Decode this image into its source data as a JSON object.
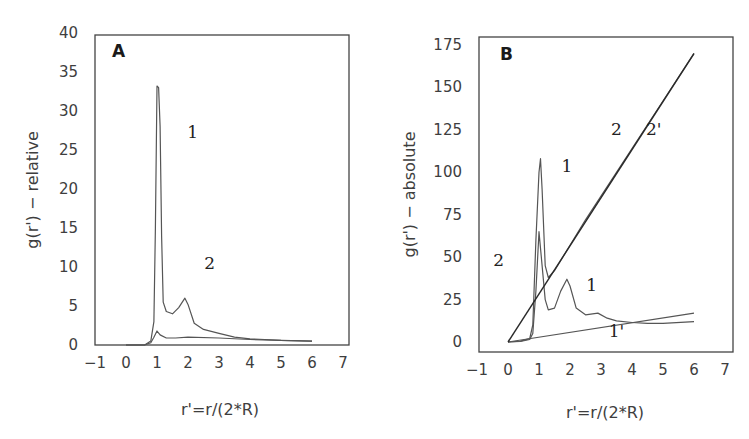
{
  "chart_data": [
    {
      "panel": "A",
      "type": "line",
      "title": "A",
      "xlabel": "r'=r/(2*R)",
      "ylabel": "g(r') − relative",
      "xlim": [
        -1,
        7
      ],
      "ylim": [
        0,
        40
      ],
      "xticks": [
        "−1",
        "0",
        "1",
        "2",
        "3",
        "4",
        "5",
        "6",
        "7"
      ],
      "yticks": [
        "0",
        "5",
        "10",
        "15",
        "20",
        "25",
        "30",
        "35",
        "40"
      ],
      "grid": false,
      "legend": "inline labels",
      "series": [
        {
          "name": "1",
          "x": [
            0.0,
            0.6,
            0.8,
            0.9,
            0.95,
            1.0,
            1.05,
            1.1,
            1.15,
            1.2,
            1.3,
            1.5,
            1.7,
            1.9,
            2.0,
            2.2,
            2.5,
            3.0,
            3.5,
            4.0,
            5.0,
            6.0
          ],
          "y": [
            0.0,
            0.0,
            0.5,
            3.0,
            15.0,
            33.2,
            33.0,
            28.0,
            14.0,
            5.5,
            4.3,
            4.0,
            4.8,
            6.0,
            5.2,
            2.8,
            2.0,
            1.5,
            1.0,
            0.8,
            0.6,
            0.5
          ]
        },
        {
          "name": "2",
          "x": [
            0.0,
            0.6,
            0.8,
            0.9,
            1.0,
            1.1,
            1.3,
            1.6,
            2.0,
            3.0,
            4.0,
            5.0,
            6.0
          ],
          "y": [
            0.0,
            0.0,
            0.3,
            1.0,
            1.8,
            1.3,
            0.9,
            0.9,
            1.0,
            0.9,
            0.7,
            0.6,
            0.5
          ]
        }
      ],
      "annotations": [
        {
          "text": "1",
          "x": 2.15,
          "y": 26.5
        },
        {
          "text": "2",
          "x": 2.7,
          "y": 9.8
        }
      ]
    },
    {
      "panel": "B",
      "type": "line",
      "title": "B",
      "xlabel": "r'=r/(2*R)",
      "ylabel": "g(r') − absolute",
      "xlim": [
        -1,
        7
      ],
      "ylim": [
        0,
        175
      ],
      "xticks": [
        "−1",
        "0",
        "1",
        "2",
        "3",
        "4",
        "5",
        "6",
        "7"
      ],
      "yticks": [
        "0",
        "25",
        "50",
        "75",
        "100",
        "125",
        "150",
        "175"
      ],
      "grid": false,
      "legend": "inline labels",
      "series": [
        {
          "name": "1",
          "x": [
            0.0,
            0.4,
            0.7,
            0.8,
            0.9,
            1.0,
            1.1,
            1.2,
            1.3,
            1.5,
            1.7,
            1.9,
            2.0,
            2.2,
            2.5,
            2.9,
            3.2,
            3.5,
            4.0,
            4.5,
            5.0,
            6.0
          ],
          "y": [
            0.0,
            0.3,
            1.5,
            5.0,
            30.0,
            65.0,
            45.0,
            25.0,
            19.0,
            20.0,
            30.0,
            37.0,
            33.0,
            20.0,
            16.0,
            17.0,
            14.0,
            12.5,
            11.5,
            11.0,
            11.0,
            12.0
          ]
        },
        {
          "name": "2",
          "x": [
            0.0,
            0.4,
            0.7,
            0.8,
            0.9,
            1.0,
            1.05,
            1.1,
            1.2,
            1.3,
            1.5,
            2.0,
            2.5,
            3.0,
            3.5,
            4.0,
            5.0,
            6.0
          ],
          "y": [
            0.0,
            0.5,
            2.0,
            10.0,
            60.0,
            100.0,
            108.0,
            90.0,
            45.0,
            38.0,
            42.0,
            57.0,
            72.0,
            86.0,
            100.0,
            114.0,
            142.0,
            170.0
          ]
        },
        {
          "name": "1'",
          "x": [
            0.0,
            6.0
          ],
          "y": [
            0.0,
            17.0
          ]
        },
        {
          "name": "2'",
          "x": [
            0.0,
            6.0
          ],
          "y": [
            0.0,
            170.0
          ]
        }
      ],
      "annotations": [
        {
          "text": "1",
          "x": 1.9,
          "y": 100
        },
        {
          "text": "2",
          "x": 3.5,
          "y": 122
        },
        {
          "text": "2'",
          "x": 4.7,
          "y": 122
        },
        {
          "text": "2",
          "x": -0.3,
          "y": 45
        },
        {
          "text": "1",
          "x": 2.7,
          "y": 30
        },
        {
          "text": "1'",
          "x": 3.5,
          "y": 3
        }
      ]
    }
  ]
}
